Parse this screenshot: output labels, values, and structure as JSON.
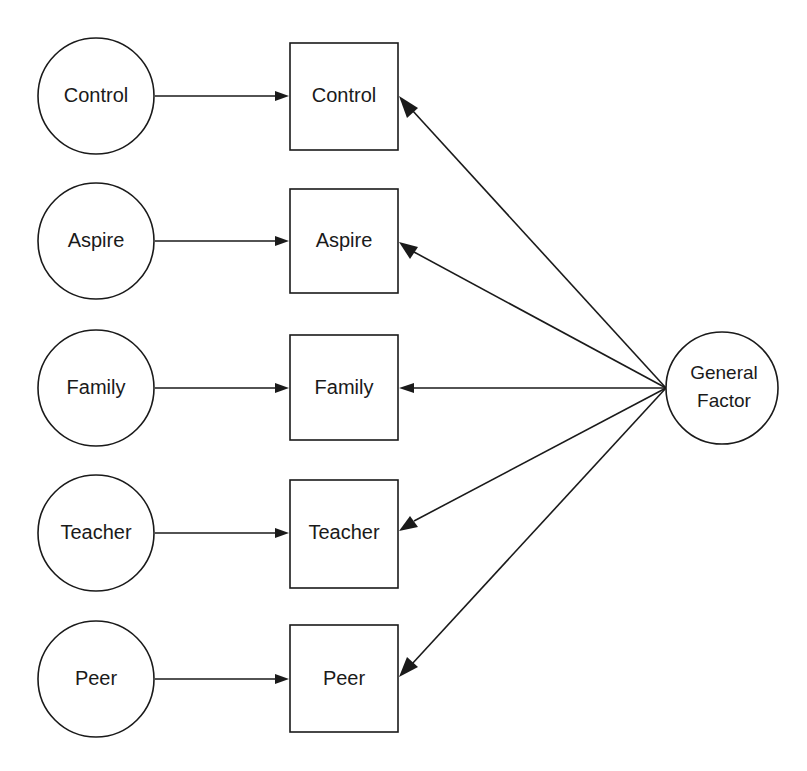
{
  "diagram": {
    "type": "path-diagram",
    "title": "",
    "background_color": "#ffffff",
    "stroke_color": "#1a1a1a",
    "latent_nodes": [
      {
        "id": "circle-control",
        "label": "Control",
        "shape": "circle",
        "cx": 96,
        "cy": 96,
        "r": 58
      },
      {
        "id": "circle-aspire",
        "label": "Aspire",
        "shape": "circle",
        "cx": 96,
        "cy": 241,
        "r": 58
      },
      {
        "id": "circle-family",
        "label": "Family",
        "shape": "circle",
        "cx": 96,
        "cy": 388,
        "r": 58
      },
      {
        "id": "circle-teacher",
        "label": "Teacher",
        "shape": "circle",
        "cx": 96,
        "cy": 533,
        "r": 58
      },
      {
        "id": "circle-peer",
        "label": "Peer",
        "shape": "circle",
        "cx": 96,
        "cy": 679,
        "r": 58
      }
    ],
    "observed_nodes": [
      {
        "id": "box-control",
        "label": "Control",
        "shape": "rect",
        "x": 290,
        "y": 43,
        "w": 108,
        "h": 107
      },
      {
        "id": "box-aspire",
        "label": "Aspire",
        "shape": "rect",
        "x": 290,
        "y": 189,
        "w": 108,
        "h": 104
      },
      {
        "id": "box-family",
        "label": "Family",
        "shape": "rect",
        "x": 290,
        "y": 335,
        "w": 108,
        "h": 105
      },
      {
        "id": "box-teacher",
        "label": "Teacher",
        "shape": "rect",
        "x": 290,
        "y": 480,
        "w": 108,
        "h": 108
      },
      {
        "id": "box-peer",
        "label": "Peer",
        "shape": "rect",
        "x": 290,
        "y": 625,
        "w": 108,
        "h": 107
      }
    ],
    "factor_node": {
      "id": "circle-general-factor",
      "label_line_1": "General",
      "label_line_2": "Factor",
      "shape": "circle",
      "cx": 722,
      "cy": 388,
      "r": 56
    },
    "edges_left": [
      {
        "id": "edge-control-in",
        "from": "circle-control",
        "to": "box-control",
        "x1": 155,
        "y1": 96,
        "x2": 288,
        "y2": 96
      },
      {
        "id": "edge-aspire-in",
        "from": "circle-aspire",
        "to": "box-aspire",
        "x1": 155,
        "y1": 241,
        "x2": 288,
        "y2": 241
      },
      {
        "id": "edge-family-in",
        "from": "circle-family",
        "to": "box-family",
        "x1": 155,
        "y1": 388,
        "x2": 288,
        "y2": 388
      },
      {
        "id": "edge-teacher-in",
        "from": "circle-teacher",
        "to": "box-teacher",
        "x1": 155,
        "y1": 533,
        "x2": 288,
        "y2": 533
      },
      {
        "id": "edge-peer-in",
        "from": "circle-peer",
        "to": "box-peer",
        "x1": 155,
        "y1": 679,
        "x2": 288,
        "y2": 679
      }
    ],
    "edges_right": [
      {
        "id": "edge-factor-control",
        "from": "circle-general-factor",
        "to": "box-control",
        "x1": 666,
        "y1": 388,
        "x2": 400,
        "y2": 97
      },
      {
        "id": "edge-factor-aspire",
        "from": "circle-general-factor",
        "to": "box-aspire",
        "x1": 666,
        "y1": 388,
        "x2": 400,
        "y2": 243
      },
      {
        "id": "edge-factor-family",
        "from": "circle-general-factor",
        "to": "box-family",
        "x1": 666,
        "y1": 388,
        "x2": 400,
        "y2": 388
      },
      {
        "id": "edge-factor-teacher",
        "from": "circle-general-factor",
        "to": "box-teacher",
        "x1": 666,
        "y1": 388,
        "x2": 400,
        "y2": 531
      },
      {
        "id": "edge-factor-peer",
        "from": "circle-general-factor",
        "to": "box-peer",
        "x1": 666,
        "y1": 388,
        "x2": 400,
        "y2": 677
      }
    ]
  }
}
